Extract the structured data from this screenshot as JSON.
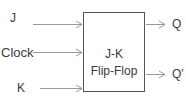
{
  "diagram": {
    "block": {
      "title_line1": "J-K",
      "title_line2": "Flip-Flop"
    },
    "inputs": [
      {
        "label": "J"
      },
      {
        "label": "Clock"
      },
      {
        "label": "K"
      }
    ],
    "outputs": [
      {
        "label": "Q"
      },
      {
        "label": "Q'"
      }
    ],
    "colors": {
      "line": "#999999",
      "box_border": "#555555",
      "text": "#3a3a3a"
    }
  }
}
